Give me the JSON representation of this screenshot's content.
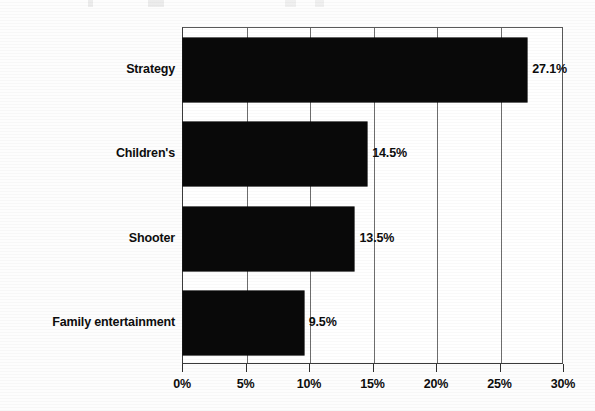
{
  "chart_data": {
    "type": "bar",
    "orientation": "horizontal",
    "title": "",
    "xlabel": "",
    "ylabel": "",
    "categories": [
      "Strategy",
      "Children's",
      "Shooter",
      "Family entertainment"
    ],
    "values": [
      27.1,
      14.5,
      13.5,
      9.5
    ],
    "data_labels": [
      "27.1%",
      "14.5%",
      "13.5%",
      "9.5%"
    ],
    "xlim": [
      0,
      30
    ],
    "xtick_values": [
      0,
      5,
      10,
      15,
      20,
      25,
      30
    ],
    "xtick_labels": [
      "0%",
      "5%",
      "10%",
      "15%",
      "20%",
      "25%",
      "30%"
    ],
    "grid": true,
    "grid_axis": "x",
    "legend": null,
    "bar_color": "#090909",
    "plot_background": "#ffffff",
    "axis_color": "#3a3a3a",
    "text_color": "#0d0d0d"
  }
}
